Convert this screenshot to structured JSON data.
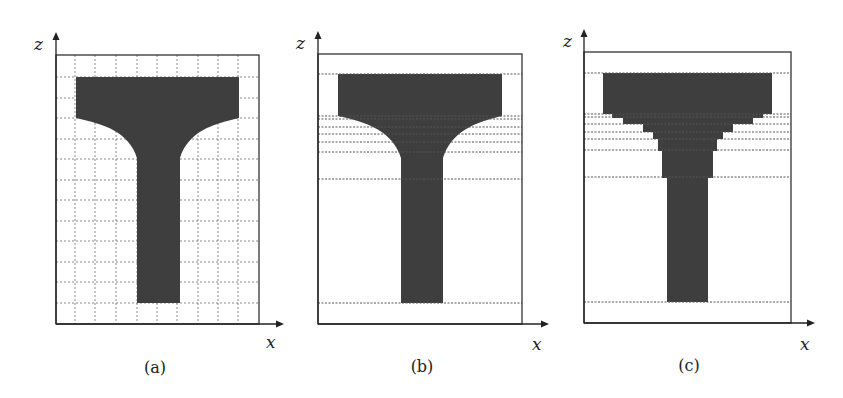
{
  "figure": {
    "panels": [
      {
        "id": "a",
        "caption": "(a)",
        "x_axis_label": "x",
        "z_axis_label": "z",
        "description": "T-shaped cross-section with curved fillets overlaid on a uniform dashed grid"
      },
      {
        "id": "b",
        "caption": "(b)",
        "x_axis_label": "x",
        "z_axis_label": "z",
        "description": "T-shaped cross-section with curved fillets and non-uniform horizontal dashed slice lines"
      },
      {
        "id": "c",
        "caption": "(c)",
        "x_axis_label": "x",
        "z_axis_label": "z",
        "description": "Stepped (staircase) approximation of the T-shaped cross-section using horizontal slices"
      }
    ],
    "colors": {
      "shape_fill": "#3e3e3e",
      "frame": "#333333",
      "grid": "#7a7a7a",
      "background": "#ffffff"
    }
  }
}
